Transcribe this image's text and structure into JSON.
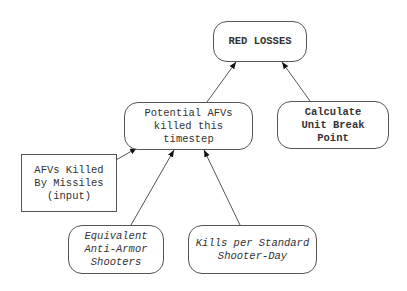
{
  "diagram": {
    "nodes": {
      "red_losses": {
        "label": "RED LOSSES",
        "style": "bold"
      },
      "potential_afvs": {
        "label": "Potential AFVs\nkilled this\ntimestep",
        "style": "normal"
      },
      "break_point": {
        "label": "Calculate\nUnit Break\nPoint",
        "style": "bold"
      },
      "afvs_missiles": {
        "label": "AFVs Killed\nBy Missiles\n(input)",
        "style": "normal"
      },
      "equiv_shooters": {
        "label": "Equivalent\nAnti-Armor\nShooters",
        "style": "italic"
      },
      "kills_per_day": {
        "label": "Kills per Standard\nShooter-Day",
        "style": "italic"
      }
    },
    "edges": [
      {
        "from": "potential_afvs",
        "to": "red_losses"
      },
      {
        "from": "break_point",
        "to": "red_losses"
      },
      {
        "from": "afvs_missiles",
        "to": "potential_afvs"
      },
      {
        "from": "equiv_shooters",
        "to": "potential_afvs"
      },
      {
        "from": "kills_per_day",
        "to": "potential_afvs"
      }
    ]
  }
}
